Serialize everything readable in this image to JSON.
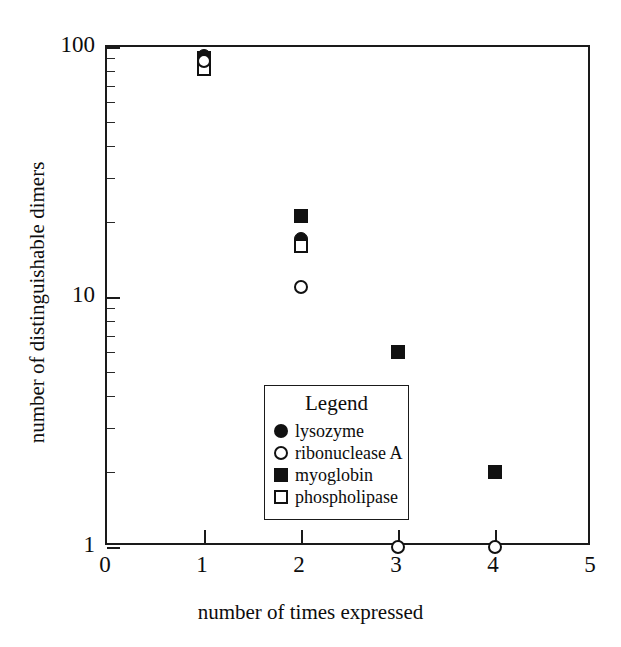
{
  "chart_data": {
    "type": "scatter",
    "title": "",
    "xlabel": "number of times expressed",
    "ylabel": "number of distinguishable dimers",
    "xlim": [
      0,
      5
    ],
    "ylim": [
      1,
      100
    ],
    "yscale": "log",
    "xscale": "linear",
    "grid": false,
    "legend_position": "inside-lower-left",
    "legend_title": "Legend",
    "xticks": [
      "0",
      "1",
      "2",
      "3",
      "4",
      "5"
    ],
    "xtick_values": [
      0,
      1,
      2,
      3,
      4,
      5
    ],
    "yticks": [
      "1",
      "10",
      "100"
    ],
    "ytick_values": [
      1,
      10,
      100
    ],
    "yminor_values": [
      2,
      3,
      4,
      5,
      6,
      7,
      8,
      9,
      20,
      30,
      40,
      50,
      60,
      70,
      80,
      90
    ],
    "series": [
      {
        "name": "lysozyme",
        "marker": "filled-circle",
        "color": "#111111",
        "x": [
          1,
          2
        ],
        "y": [
          92,
          17
        ]
      },
      {
        "name": "ribonuclease A",
        "marker": "open-circle",
        "color": "#111111",
        "x": [
          1,
          2,
          3,
          4
        ],
        "y": [
          88,
          11,
          1,
          1
        ]
      },
      {
        "name": "myoglobin",
        "marker": "filled-square",
        "color": "#111111",
        "x": [
          1,
          2,
          3,
          4
        ],
        "y": [
          90,
          21,
          6,
          2
        ]
      },
      {
        "name": "phospholipase",
        "marker": "open-square",
        "color": "#111111",
        "x": [
          1,
          2,
          3
        ],
        "y": [
          82,
          16,
          2
        ]
      }
    ]
  },
  "legend": {
    "title": "Legend",
    "entries": [
      {
        "label": "lysozyme",
        "marker": "filled-circle"
      },
      {
        "label": "ribonuclease A",
        "marker": "open-circle"
      },
      {
        "label": "myoglobin",
        "marker": "filled-square"
      },
      {
        "label": "phospholipase",
        "marker": "open-square"
      }
    ]
  },
  "axes": {
    "x_title": "number of times expressed",
    "y_title": "number of distinguishable dimers",
    "x_tick_labels": [
      "0",
      "1",
      "2",
      "3",
      "4",
      "5"
    ],
    "y_tick_labels": [
      "1",
      "10",
      "100"
    ]
  }
}
